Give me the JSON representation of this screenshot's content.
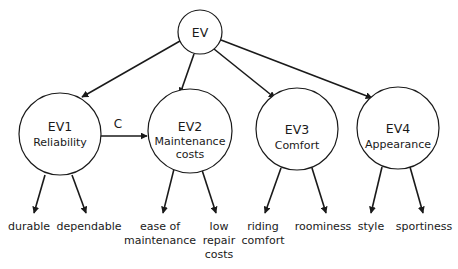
{
  "diagram": {
    "root": {
      "id": "EV",
      "label": "EV"
    },
    "latent_nodes": [
      {
        "id": "EV1",
        "code": "EV1",
        "name": [
          "Reliability"
        ]
      },
      {
        "id": "EV2",
        "code": "EV2",
        "name": [
          "Maintenance",
          "costs"
        ]
      },
      {
        "id": "EV3",
        "code": "EV3",
        "name": [
          "Comfort"
        ]
      },
      {
        "id": "EV4",
        "code": "EV4",
        "name": [
          "Appearance"
        ]
      }
    ],
    "edge_labels": {
      "ev1_to_ev2": "C"
    },
    "indicators": [
      {
        "parent": "EV1",
        "lines": [
          "durable"
        ]
      },
      {
        "parent": "EV1",
        "lines": [
          "dependable"
        ]
      },
      {
        "parent": "EV2",
        "lines": [
          "ease of",
          "maintenance"
        ]
      },
      {
        "parent": "EV2",
        "lines": [
          "low",
          "repair",
          "costs"
        ]
      },
      {
        "parent": "EV3",
        "lines": [
          "riding",
          "comfort"
        ]
      },
      {
        "parent": "EV3",
        "lines": [
          "roominess"
        ]
      },
      {
        "parent": "EV4",
        "lines": [
          "style"
        ]
      },
      {
        "parent": "EV4",
        "lines": [
          "sportiness"
        ]
      }
    ],
    "colors": {
      "stroke": "#1a1a1a",
      "background": "#ffffff"
    }
  }
}
